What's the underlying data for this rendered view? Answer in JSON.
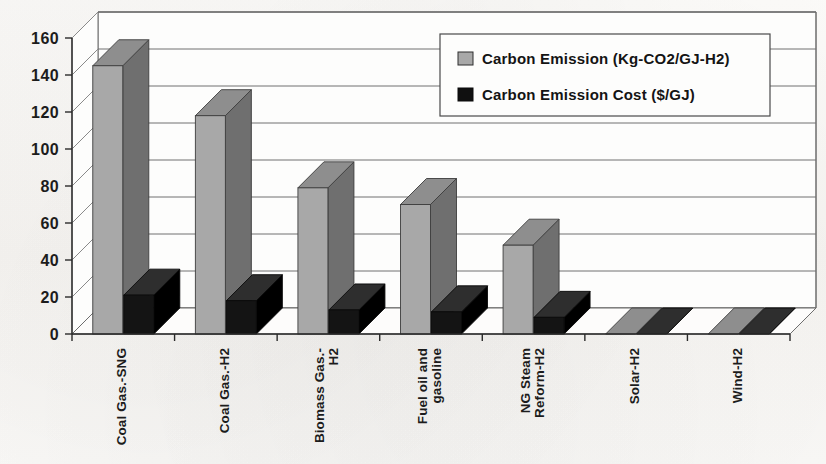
{
  "chart_data": {
    "type": "bar",
    "title": "",
    "subtitle": "",
    "xlabel": "",
    "ylabel": "",
    "ylim": [
      0,
      160
    ],
    "yticks": [
      0,
      20,
      40,
      60,
      80,
      100,
      120,
      140,
      160
    ],
    "grid": true,
    "style": "3d-clustered-column",
    "legend_position": "top-right",
    "categories": [
      "Coal Gas.-SNG",
      "Coal Gas.-H2",
      "Biomass Gas.-H2",
      "Fuel oil and gasoline",
      "NG Steam Reform-H2",
      "Solar-H2",
      "Wind-H2"
    ],
    "series": [
      {
        "name": "Carbon Emission (Kg-CO2/GJ-H2)",
        "color": "#a8a8a8",
        "values": [
          145,
          118,
          79,
          70,
          48,
          0,
          0
        ]
      },
      {
        "name": "Carbon Emission Cost ($/GJ)",
        "color": "#141414",
        "values": [
          21,
          18,
          13,
          12,
          9,
          0,
          0
        ]
      }
    ]
  },
  "legend": {
    "entries": [
      {
        "label": "Carbon Emission (Kg-CO2/GJ-H2)",
        "swatch": "gray"
      },
      {
        "label": "Carbon Emission Cost ($/GJ)",
        "swatch": "black"
      }
    ]
  },
  "axis": {
    "y_tick_labels": [
      "160",
      "140",
      "120",
      "100",
      "80",
      "60",
      "40",
      "20",
      "0"
    ],
    "x_tick_labels": [
      "Coal Gas.-SNG",
      "Coal Gas.-H2",
      "Biomass Gas.-H2",
      "Fuel oil and gasoline",
      "NG Steam Reform-H2",
      "Solar-H2",
      "Wind-H2"
    ]
  }
}
